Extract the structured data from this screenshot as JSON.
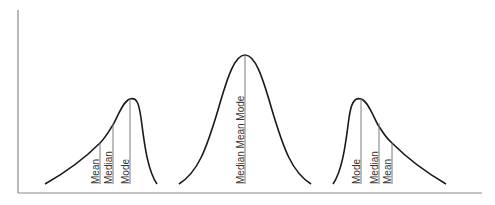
{
  "diagram": {
    "title": "",
    "panels": [
      {
        "name": "negatively-skewed",
        "labels": [
          "Mean",
          "Median",
          "Mode"
        ]
      },
      {
        "name": "symmetric",
        "labels": [
          "Median Mean Mode"
        ]
      },
      {
        "name": "positively-skewed",
        "labels": [
          "Mode",
          "Median",
          "Mean"
        ]
      }
    ]
  },
  "colors": {
    "curve": "#1a1a1a",
    "axis": "#8a8a8a",
    "marker": "#7a7a7a",
    "text": "#333333",
    "background": "#ffffff"
  }
}
